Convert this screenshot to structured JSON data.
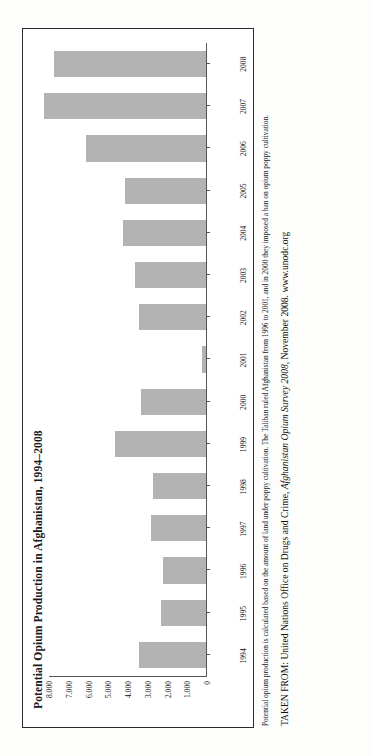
{
  "chart_data": {
    "type": "bar",
    "title": "Potential Opium Production in Afghanistan, 1994–2008",
    "xlabel": "",
    "ylabel": "",
    "ylim": [
      0,
      8000
    ],
    "grid": false,
    "legend": "none",
    "bar_color": "#b3b3b3",
    "categories": [
      "1994",
      "1995",
      "1996",
      "1997",
      "1998",
      "1999",
      "2000",
      "2001",
      "2002",
      "2003",
      "2004",
      "2005",
      "2006",
      "2007",
      "2008"
    ],
    "values": [
      3400,
      2300,
      2200,
      2800,
      2700,
      4600,
      3300,
      185,
      3400,
      3600,
      4200,
      4100,
      6100,
      8200,
      7700
    ],
    "ytick_labels": [
      "8.000",
      "7.000",
      "6.000",
      "5.000",
      "4.000",
      "3.000",
      "2.000",
      "1.000",
      "0"
    ],
    "ytick_values": [
      8000,
      7000,
      6000,
      5000,
      4000,
      3000,
      2000,
      1000,
      0
    ]
  },
  "caption": {
    "note": "Potential opium production is calculated based on the amount of land under poppy cultivation. The Taliban ruled Afghanistan from 1996 to 2001, and in 2000 they imposed a ban on opium poppy cultivation.",
    "source_prefix": "TAKEN FROM: United Nations Office on Drugs and Crime, ",
    "source_italic": "Afghanistan Opium Survey 2008,",
    "source_suffix": " November 2008. www.unodc.org"
  }
}
